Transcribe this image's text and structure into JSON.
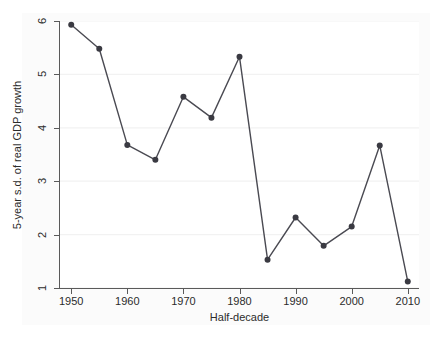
{
  "chart_data": {
    "type": "line",
    "title": "",
    "xlabel": "Half-decade",
    "ylabel": "5-year s.d. of real GDP growth",
    "x": [
      1950,
      1955,
      1960,
      1965,
      1970,
      1975,
      1980,
      1985,
      1990,
      1995,
      2000,
      2005,
      2010
    ],
    "values": [
      5.93,
      5.48,
      3.68,
      3.4,
      4.58,
      4.19,
      5.33,
      1.53,
      2.32,
      1.79,
      2.15,
      3.67,
      1.12
    ],
    "series": [
      {
        "name": "5-year s.d. of real GDP growth",
        "values": [
          5.93,
          5.48,
          3.68,
          3.4,
          4.58,
          4.19,
          5.33,
          1.53,
          2.32,
          1.79,
          2.15,
          3.67,
          1.12
        ]
      }
    ],
    "xlim": [
      1948,
      2012
    ],
    "ylim": [
      1,
      6
    ],
    "x_ticks": [
      1950,
      1960,
      1970,
      1980,
      1990,
      2000,
      2010
    ],
    "x_tick_labels": [
      "1950",
      "1960",
      "1970",
      "1980",
      "1990",
      "2000",
      "2010"
    ],
    "y_ticks": [
      1,
      2,
      3,
      4,
      5,
      6
    ],
    "y_tick_labels": [
      "1",
      "2",
      "3",
      "4",
      "5",
      "6"
    ],
    "grid": "horizontal",
    "legend": "none",
    "marker": "filled-circle",
    "line_color": "#4a4a52",
    "marker_color": "#3a3a42",
    "grid_color": "#f2f2f2",
    "axis_color": "#5a5a5a",
    "plot_background": "#ffffff",
    "figure_background": "#fbfbfb"
  }
}
